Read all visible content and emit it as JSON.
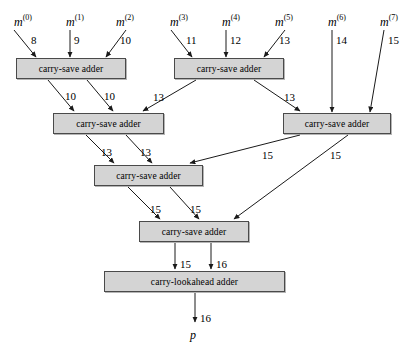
{
  "diagram": {
    "inputs": [
      {
        "name": "m",
        "index": "(0)",
        "x": 14,
        "y": 14,
        "bits": "8",
        "bx": 31,
        "by": 34,
        "lx": 14,
        "ly": 26,
        "tx": 36,
        "ty": 57,
        "style": "diag-right"
      },
      {
        "name": "m",
        "index": "(1)",
        "x": 66,
        "y": 14,
        "bits": "9",
        "bx": 74,
        "by": 34,
        "lx": 70,
        "ly": 26,
        "tx": 70,
        "ty": 57,
        "style": "vertical"
      },
      {
        "name": "m",
        "index": "(2)",
        "x": 116,
        "y": 14,
        "bits": "10",
        "bx": 120,
        "by": 34,
        "lx": 126,
        "ly": 26,
        "tx": 106,
        "ty": 57,
        "style": "diag-left"
      },
      {
        "name": "m",
        "index": "(3)",
        "x": 170,
        "y": 14,
        "bits": "11",
        "bx": 186,
        "by": 34,
        "lx": 171,
        "ly": 26,
        "tx": 192,
        "ty": 57,
        "style": "diag-right"
      },
      {
        "name": "m",
        "index": "(4)",
        "x": 222,
        "y": 14,
        "bits": "12",
        "bx": 230,
        "by": 34,
        "lx": 226,
        "ly": 26,
        "tx": 226,
        "ty": 57,
        "style": "vertical"
      },
      {
        "name": "m",
        "index": "(5)",
        "x": 275,
        "y": 14,
        "bits": "13",
        "bx": 279,
        "by": 34,
        "lx": 285,
        "ly": 26,
        "tx": 264,
        "ty": 57,
        "style": "diag-left"
      },
      {
        "name": "m",
        "index": "(6)",
        "x": 328,
        "y": 14,
        "bits": "14",
        "bx": 336,
        "by": 34,
        "lx": 332,
        "ly": 26,
        "tx": 332,
        "ty": 112,
        "style": "vertical"
      },
      {
        "name": "m",
        "index": "(7)",
        "x": 380,
        "y": 14,
        "bits": "15",
        "bx": 388,
        "by": 34,
        "lx": 384,
        "ly": 26,
        "tx": 370,
        "ty": 112,
        "style": "diag-left"
      }
    ],
    "adders": [
      {
        "id": "csa1",
        "label": "carry-save adder",
        "x": 16,
        "y": 58,
        "w": 110,
        "h": 21
      },
      {
        "id": "csa2",
        "label": "carry-save adder",
        "x": 174,
        "y": 58,
        "w": 110,
        "h": 21
      },
      {
        "id": "csa3",
        "label": "carry-save adder",
        "x": 53,
        "y": 113,
        "w": 111,
        "h": 21
      },
      {
        "id": "csa4",
        "label": "carry-save adder",
        "x": 283,
        "y": 113,
        "w": 108,
        "h": 21
      },
      {
        "id": "csa5",
        "label": "carry-save adder",
        "x": 94,
        "y": 165,
        "w": 109,
        "h": 21
      },
      {
        "id": "csa6",
        "label": "carry-save adder",
        "x": 139,
        "y": 221,
        "w": 110,
        "h": 21
      },
      {
        "id": "cla",
        "label": "carry-lookahead adder",
        "x": 104,
        "y": 271,
        "w": 181,
        "h": 21
      }
    ],
    "wires": [
      {
        "from": "csa1",
        "to": "csa3",
        "bits": "10",
        "lx": 65,
        "ly": 90,
        "x1": 48,
        "y1": 80,
        "x2": 74,
        "y2": 111
      },
      {
        "from": "csa1",
        "to": "csa3",
        "bits": "10",
        "lx": 104,
        "ly": 90,
        "x1": 87,
        "y1": 80,
        "x2": 113,
        "y2": 111
      },
      {
        "from": "csa2",
        "to": "csa3",
        "bits": "13",
        "lx": 153,
        "ly": 91,
        "x1": 196,
        "y1": 80,
        "x2": 143,
        "y2": 111
      },
      {
        "from": "csa2",
        "to": "csa4",
        "bits": "13",
        "lx": 284,
        "ly": 91,
        "x1": 254,
        "y1": 80,
        "x2": 300,
        "y2": 111
      },
      {
        "from": "csa3",
        "to": "csa5",
        "bits": "13",
        "lx": 101,
        "ly": 146,
        "x1": 86,
        "y1": 135,
        "x2": 114,
        "y2": 163
      },
      {
        "from": "csa3",
        "to": "csa5",
        "bits": "13",
        "lx": 140,
        "ly": 146,
        "x1": 126,
        "y1": 135,
        "x2": 152,
        "y2": 163
      },
      {
        "from": "csa4",
        "to": "csa5",
        "bits": "15",
        "lx": 262,
        "ly": 149,
        "x1": 300,
        "y1": 135,
        "x2": 190,
        "y2": 163
      },
      {
        "from": "csa4",
        "to": "csa6",
        "bits": "15",
        "lx": 330,
        "ly": 149,
        "x1": 348,
        "y1": 135,
        "x2": 234,
        "y2": 219
      },
      {
        "from": "csa5",
        "to": "csa6",
        "bits": "15",
        "lx": 150,
        "ly": 203,
        "x1": 128,
        "y1": 187,
        "x2": 160,
        "y2": 219
      },
      {
        "from": "csa5",
        "to": "csa6",
        "bits": "15",
        "lx": 190,
        "ly": 203,
        "x1": 170,
        "y1": 187,
        "x2": 199,
        "y2": 219
      },
      {
        "from": "csa6",
        "to": "cla",
        "bits": "15",
        "lx": 180,
        "ly": 258,
        "x1": 175,
        "y1": 243,
        "x2": 175,
        "y2": 269
      },
      {
        "from": "csa6",
        "to": "cla",
        "bits": "16",
        "lx": 216,
        "ly": 258,
        "x1": 211,
        "y1": 243,
        "x2": 211,
        "y2": 269
      },
      {
        "from": "cla",
        "to": "p",
        "bits": "16",
        "lx": 200,
        "ly": 312,
        "x1": 195,
        "y1": 293,
        "x2": 195,
        "y2": 322
      }
    ],
    "output": {
      "name": "p",
      "x": 190,
      "y": 328
    }
  }
}
